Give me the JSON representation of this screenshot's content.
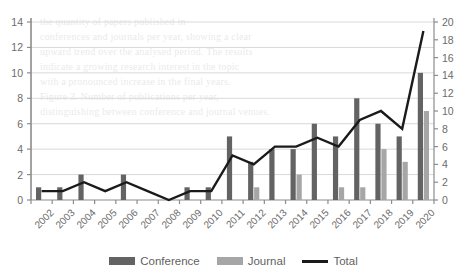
{
  "chart_data": {
    "type": "bar",
    "title": "",
    "xlabel": "",
    "ylabel": "",
    "grid": true,
    "legend_position": "bottom",
    "categories": [
      "2002",
      "2003",
      "2004",
      "2005",
      "2006",
      "2007",
      "2008",
      "2009",
      "2010",
      "2011",
      "2012",
      "2013",
      "2014",
      "2015",
      "2016",
      "2017",
      "2018",
      "2019",
      "2020"
    ],
    "left_axis": {
      "ticks": [
        0,
        2,
        4,
        6,
        8,
        10,
        12,
        14
      ],
      "ylim": [
        0,
        14
      ],
      "applies_to": [
        "Conference",
        "Journal"
      ]
    },
    "right_axis": {
      "ticks": [
        0,
        2,
        4,
        6,
        8,
        10,
        12,
        14,
        16,
        18,
        20
      ],
      "ylim": [
        0,
        20
      ],
      "applies_to": [
        "Total"
      ]
    },
    "series": [
      {
        "name": "Conference",
        "kind": "bar",
        "axis": "left",
        "color": "#636363",
        "values": [
          1,
          1,
          2,
          0,
          2,
          0,
          0,
          1,
          1,
          5,
          3,
          4,
          4,
          6,
          5,
          8,
          6,
          5,
          10
        ]
      },
      {
        "name": "Journal",
        "kind": "bar",
        "axis": "left",
        "color": "#a6a6a6",
        "values": [
          0,
          0,
          0,
          0,
          0,
          0,
          0,
          0,
          0,
          0,
          1,
          0,
          2,
          0,
          1,
          1,
          4,
          3,
          7
        ]
      },
      {
        "name": "Total",
        "kind": "line",
        "axis": "right",
        "color": "#1a1a1a",
        "values": [
          1,
          1,
          2,
          1,
          2,
          1,
          0,
          1,
          1,
          5,
          4,
          6,
          6,
          7,
          6,
          9,
          10,
          8,
          19
        ]
      }
    ]
  },
  "legend": {
    "entries": [
      {
        "label": "Conference",
        "type": "bar",
        "color": "#636363"
      },
      {
        "label": "Journal",
        "type": "bar",
        "color": "#a6a6a6"
      },
      {
        "label": "Total",
        "type": "line",
        "color": "#1a1a1a"
      }
    ]
  },
  "background_text": [
    "the quantity of papers published in",
    "conferences and journals per year, showing a clear",
    "upward trend over the analysed period. The results",
    "indicate a growing research interest in the topic",
    "with a pronounced increase in the final years.",
    "",
    "",
    "",
    "",
    "Figure 3. Number of publications per year,",
    "distinguishing between conference and journal venues.",
    "",
    ""
  ]
}
